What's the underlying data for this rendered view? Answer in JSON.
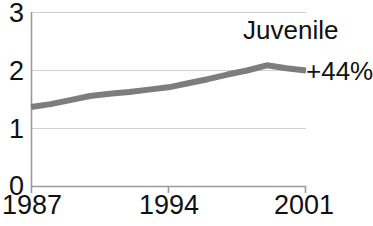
{
  "chart_data": {
    "type": "line",
    "title": "",
    "subtitle": "",
    "xlabel": "",
    "ylabel": "",
    "legend_position": "inline-right",
    "grid": true,
    "grid_axis": "y",
    "xlim": [
      1987,
      2001
    ],
    "ylim": [
      0,
      3
    ],
    "yticks": [
      "0",
      "1",
      "2",
      "3"
    ],
    "ytick_values": [
      0,
      1,
      2,
      3
    ],
    "xticks": [
      "1987",
      "1994",
      "2001"
    ],
    "xtick_values": [
      1987,
      1994,
      2001
    ],
    "line_color": "#7d7d7d",
    "line_width": 6,
    "series": [
      {
        "name": "Juvenile",
        "annotation": "+44%",
        "color": "#7d7d7d",
        "x": [
          1987,
          1988,
          1989,
          1990,
          1991,
          1992,
          1993,
          1994,
          1995,
          1996,
          1997,
          1998,
          1999,
          2000,
          2001
        ],
        "values": [
          1.37,
          1.42,
          1.49,
          1.56,
          1.6,
          1.63,
          1.67,
          1.71,
          1.78,
          1.85,
          1.93,
          2.0,
          2.09,
          2.04,
          2.0
        ]
      }
    ]
  },
  "axes": {
    "y_axis_labels": [
      "3",
      "2",
      "1",
      "0"
    ],
    "x_axis_labels": [
      "1987",
      "1994",
      "2001"
    ]
  },
  "annotations": {
    "series_name": "Juvenile",
    "percent_change": "+44%"
  },
  "colors": {
    "line": "#7d7d7d",
    "grid": "#cfcfcf",
    "axis": "#9a9a9a",
    "text": "#111111",
    "background": "#ffffff"
  }
}
